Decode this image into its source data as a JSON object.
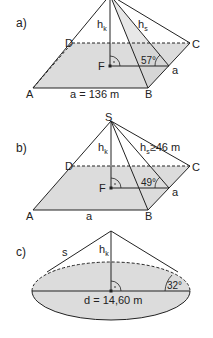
{
  "figures": [
    {
      "label": "a)",
      "vertices": {
        "A": "A",
        "B": "B",
        "C": "C",
        "D": "D",
        "F": "F"
      },
      "heights": {
        "hk": "h",
        "hk_sub": "k",
        "hs": "h",
        "hs_sub": "s"
      },
      "side_label": "a",
      "base_label": "a = 136 m",
      "angle": "57°"
    },
    {
      "label": "b)",
      "vertices": {
        "S": "S",
        "A": "A",
        "B": "B",
        "C": "C",
        "D": "D",
        "F": "F"
      },
      "heights": {
        "hk": "h",
        "hk_sub": "k",
        "hs": "h",
        "hs_sub": "s",
        "hs_value": "≥46 m"
      },
      "side_label": "a",
      "base_label": "a",
      "angle": "49°"
    },
    {
      "label": "c)",
      "slant_label": "s",
      "heights": {
        "hk": "h",
        "hk_sub": "k"
      },
      "diameter_label": "d = 14,60 m",
      "angle": "32°"
    }
  ],
  "colors": {
    "fill": "#dcdcdc",
    "line": "#222222"
  }
}
